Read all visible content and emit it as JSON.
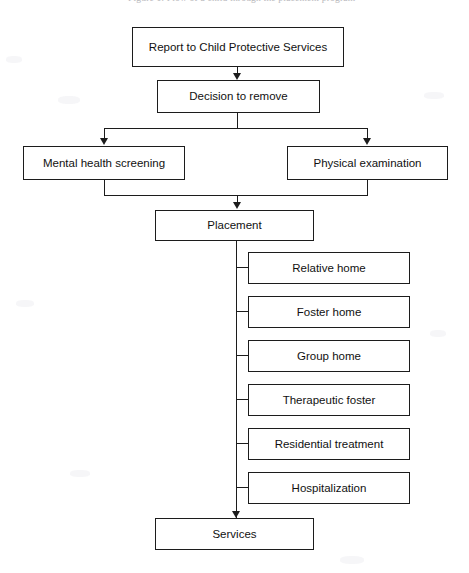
{
  "document": {
    "caption_partial": "Figure 1.  Flow of a child through the placement program"
  },
  "flowchart": {
    "type": "flowchart",
    "orientation": "top-to-bottom",
    "nodes": {
      "report": "Report to Child Protective Services",
      "decision": "Decision to remove",
      "mental_health": "Mental health screening",
      "physical_exam": "Physical examination",
      "placement": "Placement",
      "services": "Services"
    },
    "placement_options": [
      {
        "label": "Relative home"
      },
      {
        "label": "Foster home"
      },
      {
        "label": "Group home"
      },
      {
        "label": "Therapeutic foster"
      },
      {
        "label": "Residential treatment"
      },
      {
        "label": "Hospitalization"
      }
    ],
    "edges": [
      {
        "from": "Report to Child Protective Services",
        "to": "Decision to remove"
      },
      {
        "from": "Decision to remove",
        "to": "Mental health screening"
      },
      {
        "from": "Decision to remove",
        "to": "Physical examination"
      },
      {
        "from": "Mental health screening",
        "to": "Placement"
      },
      {
        "from": "Physical examination",
        "to": "Placement"
      },
      {
        "from": "Placement",
        "to": "Relative home"
      },
      {
        "from": "Placement",
        "to": "Foster home"
      },
      {
        "from": "Placement",
        "to": "Group home"
      },
      {
        "from": "Placement",
        "to": "Therapeutic foster"
      },
      {
        "from": "Placement",
        "to": "Residential treatment"
      },
      {
        "from": "Placement",
        "to": "Hospitalization"
      },
      {
        "from": "Placement",
        "to": "Services"
      }
    ],
    "colors": {
      "background": "#ffffff",
      "box_border": "#1c1c1c",
      "box_fill": "#ffffff",
      "connector": "#1c1c1c",
      "text": "#111111"
    }
  }
}
